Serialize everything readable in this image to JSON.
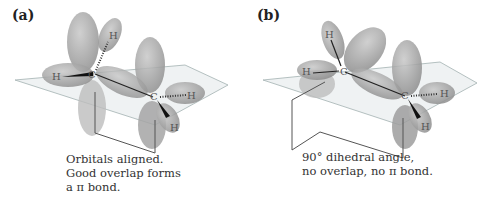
{
  "figure": {
    "panels": [
      {
        "label": "(a)",
        "description": "Ethylene with parallel p orbitals",
        "caption": [
          "Orbitals aligned.",
          "Good overlap forms",
          "a π bond."
        ],
        "atoms": {
          "c1": "C",
          "c2": "C",
          "h1": "H",
          "h2": "H",
          "h3": "H",
          "h4": "H"
        }
      },
      {
        "label": "(b)",
        "description": "Twisted ethylene with perpendicular p orbitals",
        "caption": [
          "90° dihedral angle,",
          "no overlap, no π bond."
        ],
        "atoms": {
          "c1": "C",
          "c2": "C",
          "h1": "H",
          "h2": "H",
          "h3": "H",
          "h4": "H"
        }
      }
    ],
    "colors": {
      "orbital": "#9a9a9a",
      "orbital_light": "#c4c4c4",
      "plane": "#e8ecee",
      "line": "#555555",
      "text": "#333333"
    }
  }
}
